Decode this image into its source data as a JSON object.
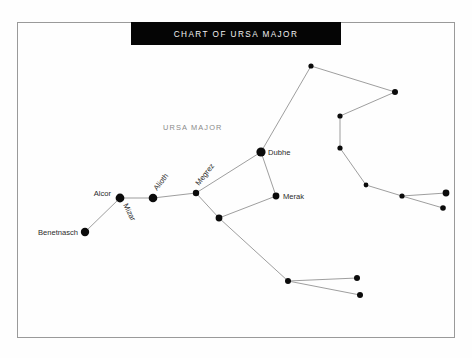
{
  "page": {
    "background_color": "#fefefe",
    "width": 472,
    "height": 358
  },
  "frame": {
    "name": "chart-frame",
    "x": 17,
    "y": 22,
    "width": 437,
    "height": 315,
    "stroke_color": "#9a9a9a"
  },
  "title_banner": {
    "text": "CHART OF URSA MAJOR",
    "background_color": "#050505",
    "text_color": "#f2f2f2",
    "x": 131,
    "y": 22,
    "width": 210,
    "height": 23
  },
  "constellation_name": {
    "text": "URSA MAJOR",
    "color": "#8a8a8a",
    "x": 163,
    "y": 130
  },
  "chart_data": {
    "type": "scatter",
    "title": "CHART OF URSA MAJOR",
    "subtitle": "URSA MAJOR",
    "xlabel": "",
    "ylabel": "",
    "grid": false,
    "legend": "none",
    "xlim": [
      0,
      472
    ],
    "ylim": [
      0,
      358
    ],
    "note": "Star chart of the constellation Ursa Major. Coordinates are screen pixels; r is plotted dot radius.",
    "stars": [
      {
        "id": "benetnasch",
        "label": "Benetnasch",
        "x": 85,
        "y": 232,
        "r": 4.2,
        "label_pos": "left",
        "label_dx": -7,
        "label_dy": 2.6,
        "label_rotation": 0
      },
      {
        "id": "mizar",
        "label": "Mizar",
        "x": 120,
        "y": 198,
        "r": 4.4,
        "label_pos": "rotated",
        "label_dx": 3,
        "label_dy": 7,
        "label_rotation": 63
      },
      {
        "id": "alcor",
        "label": "Alcor",
        "x": 120,
        "y": 198,
        "r": 0,
        "label_pos": "left",
        "label_dx": -9,
        "label_dy": -2,
        "label_rotation": 0
      },
      {
        "id": "alioth",
        "label": "Alioth",
        "x": 153,
        "y": 198,
        "r": 4.3,
        "label_pos": "rotated",
        "label_dx": 4,
        "label_dy": -7,
        "label_rotation": -52
      },
      {
        "id": "megrez",
        "label": "Megrez",
        "x": 196,
        "y": 193,
        "r": 3.2,
        "label_pos": "rotated",
        "label_dx": 3,
        "label_dy": -7,
        "label_rotation": -52
      },
      {
        "id": "dubhe",
        "label": "Dubhe",
        "x": 261,
        "y": 152,
        "r": 4.6,
        "label_pos": "right",
        "label_dx": 7,
        "label_dy": 2.8,
        "label_rotation": 0
      },
      {
        "id": "merak",
        "label": "Merak",
        "x": 276,
        "y": 196,
        "r": 3.4,
        "label_pos": "right",
        "label_dx": 7,
        "label_dy": 2.8,
        "label_rotation": 0
      },
      {
        "id": "phecda",
        "label": "",
        "x": 219,
        "y": 218,
        "r": 3.4,
        "label_pos": "none",
        "label_dx": 0,
        "label_dy": 0,
        "label_rotation": 0
      },
      {
        "id": "upper-apex",
        "label": "",
        "x": 311,
        "y": 66,
        "r": 2.6,
        "label_pos": "none",
        "label_dx": 0,
        "label_dy": 0,
        "label_rotation": 0
      },
      {
        "id": "right-apex",
        "label": "",
        "x": 395,
        "y": 92,
        "r": 3.0,
        "label_pos": "none",
        "label_dx": 0,
        "label_dy": 0,
        "label_rotation": 0
      },
      {
        "id": "neck-upper",
        "label": "",
        "x": 340,
        "y": 116,
        "r": 2.6,
        "label_pos": "none",
        "label_dx": 0,
        "label_dy": 0,
        "label_rotation": 0
      },
      {
        "id": "neck-lower",
        "label": "",
        "x": 340,
        "y": 148,
        "r": 2.6,
        "label_pos": "none",
        "label_dx": 0,
        "label_dy": 0,
        "label_rotation": 0
      },
      {
        "id": "paw-front",
        "label": "",
        "x": 366,
        "y": 185,
        "r": 2.4,
        "label_pos": "none",
        "label_dx": 0,
        "label_dy": 0,
        "label_rotation": 0
      },
      {
        "id": "paw-mid",
        "label": "",
        "x": 402,
        "y": 196,
        "r": 2.6,
        "label_pos": "none",
        "label_dx": 0,
        "label_dy": 0,
        "label_rotation": 0
      },
      {
        "id": "paw-tip-up",
        "label": "",
        "x": 446,
        "y": 193,
        "r": 3.4,
        "label_pos": "none",
        "label_dx": 0,
        "label_dy": 0,
        "label_rotation": 0
      },
      {
        "id": "paw-tip-dn",
        "label": "",
        "x": 443,
        "y": 208,
        "r": 2.8,
        "label_pos": "none",
        "label_dx": 0,
        "label_dy": 0,
        "label_rotation": 0
      },
      {
        "id": "hind-fork",
        "label": "",
        "x": 288,
        "y": 281,
        "r": 3.0,
        "label_pos": "none",
        "label_dx": 0,
        "label_dy": 0,
        "label_rotation": 0
      },
      {
        "id": "hind-up",
        "label": "",
        "x": 357,
        "y": 278,
        "r": 3.0,
        "label_pos": "none",
        "label_dx": 0,
        "label_dy": 0,
        "label_rotation": 0
      },
      {
        "id": "hind-dn",
        "label": "",
        "x": 360,
        "y": 295,
        "r": 3.0,
        "label_pos": "none",
        "label_dx": 0,
        "label_dy": 0,
        "label_rotation": 0
      }
    ],
    "lines": [
      {
        "from": "benetnasch",
        "to": "mizar"
      },
      {
        "from": "mizar",
        "to": "alioth"
      },
      {
        "from": "alioth",
        "to": "megrez"
      },
      {
        "from": "megrez",
        "to": "dubhe"
      },
      {
        "from": "megrez",
        "to": "phecda"
      },
      {
        "from": "dubhe",
        "to": "merak"
      },
      {
        "from": "merak",
        "to": "phecda"
      },
      {
        "from": "dubhe",
        "to": "upper-apex"
      },
      {
        "from": "upper-apex",
        "to": "right-apex"
      },
      {
        "from": "right-apex",
        "to": "neck-upper"
      },
      {
        "from": "neck-upper",
        "to": "neck-lower"
      },
      {
        "from": "neck-lower",
        "to": "paw-front"
      },
      {
        "from": "paw-front",
        "to": "paw-mid"
      },
      {
        "from": "paw-mid",
        "to": "paw-tip-up"
      },
      {
        "from": "paw-mid",
        "to": "paw-tip-dn"
      },
      {
        "from": "phecda",
        "to": "hind-fork"
      },
      {
        "from": "hind-fork",
        "to": "hind-up"
      },
      {
        "from": "hind-fork",
        "to": "hind-dn"
      }
    ],
    "line_color": "#8d8d8d",
    "star_color": "#0b0b0b",
    "label_color": "#2b2b2b"
  }
}
